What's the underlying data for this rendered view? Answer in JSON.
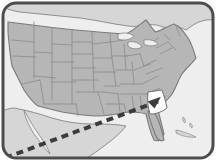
{
  "figure": {
    "type": "map-illustration",
    "width": 216,
    "height": 161,
    "frame": {
      "shape": "rounded-rectangle",
      "corner_radius": 13,
      "border_color": "#4d4d4d",
      "border_width": 3,
      "outside_color": "#ffffff"
    },
    "colors": {
      "us_states_fill": "#b6b6b6",
      "state_border": "#8f8f8f",
      "country_outline": "#7a7a7a",
      "ocean_background": "#eeeeee",
      "neighbor_land_fill": "#d6d6d6",
      "highlight_fill": "#ffffff",
      "highlight_stroke": "#6e6e6e",
      "pointer_color": "#3c3c3c",
      "frame_border": "#4d4d4d"
    },
    "regions": [
      {
        "name": "united-states",
        "fill": "#b6b6b6",
        "label": "United States"
      },
      {
        "name": "canada",
        "fill": "#d6d6d6",
        "label": "Canada"
      },
      {
        "name": "mexico",
        "fill": "#d6d6d6",
        "label": "Mexico"
      },
      {
        "name": "ocean",
        "fill": "#eeeeee",
        "label": "Ocean"
      },
      {
        "name": "caribbean-islands",
        "fill": "#d6d6d6",
        "label": "Islands"
      }
    ],
    "highlight": {
      "state_name": "Georgia",
      "fill": "#ffffff",
      "stroke": "#6e6e6e",
      "position": {
        "x": 158,
        "y": 101
      }
    },
    "pointer": {
      "style": "dashed-line-with-arrowhead",
      "color": "#3c3c3c",
      "dash_pattern": "7 5",
      "stroke_width": 4,
      "start": {
        "x": -6,
        "y": 162
      },
      "end": {
        "x": 162,
        "y": 100
      },
      "arrowhead": "triangle"
    },
    "labels": []
  }
}
